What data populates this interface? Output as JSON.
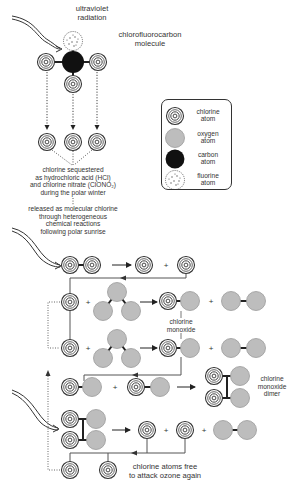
{
  "labels": {
    "uv": [
      "ultraviolet",
      "radiation"
    ],
    "cfc": [
      "chlorofluorocarbon",
      "molecule"
    ],
    "sequestered": [
      "chlorine sequestered",
      "as hydrochloric acid (HCl)",
      "and chlorine nitrate (ClONO₂)",
      "during the polar winter"
    ],
    "released": [
      "released as molecular chlorine",
      "through heterogeneous",
      "chemical reactions",
      "following polar sunrise"
    ],
    "chlorine_monoxide": [
      "chlorine",
      "monoxide"
    ],
    "dimer": [
      "chlorine",
      "monoxide",
      "dimer"
    ],
    "free": [
      "chlorine atoms free",
      "to attack ozone again"
    ]
  },
  "legend": {
    "items": [
      {
        "icon": "chlorine-atom-icon",
        "line1": "chlorine",
        "line2": "atom"
      },
      {
        "icon": "oxygen-atom-icon",
        "line1": "oxygen",
        "line2": "atom"
      },
      {
        "icon": "carbon-atom-icon",
        "line1": "carbon",
        "line2": "atom"
      },
      {
        "icon": "fluorine-atom-icon",
        "line1": "fluorine",
        "line2": "atom"
      }
    ]
  },
  "colors": {
    "oxygen": "#bdbdbd",
    "carbon": "#111111",
    "line": "#333333",
    "label": "#333333"
  }
}
